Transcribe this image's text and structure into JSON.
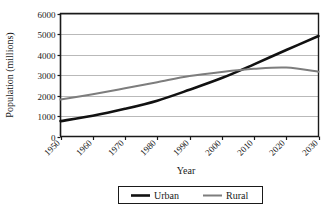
{
  "chart_data": {
    "type": "line",
    "title": "",
    "xlabel": "Year",
    "ylabel": "Population (millions)",
    "x": [
      1950,
      1960,
      1970,
      1980,
      1990,
      2000,
      2010,
      2020,
      2030
    ],
    "categories": [
      "1950",
      "1960",
      "1970",
      "1980",
      "1990",
      "2000",
      "2010",
      "2020",
      "2030"
    ],
    "series": [
      {
        "name": "Urban",
        "color": "#111111",
        "values": [
          750,
          1010,
          1350,
          1750,
          2280,
          2850,
          3520,
          4220,
          4900
        ]
      },
      {
        "name": "Rural",
        "color": "#7d7d7d",
        "values": [
          1800,
          2060,
          2350,
          2650,
          2950,
          3150,
          3300,
          3360,
          3160
        ]
      }
    ],
    "xlim": [
      1950,
      2030
    ],
    "ylim": [
      0,
      6000
    ],
    "ytick_values": [
      0,
      1000,
      2000,
      3000,
      4000,
      5000,
      6000
    ],
    "ytick_labels": [
      "0",
      "1000",
      "2000",
      "3000",
      "4000",
      "5000",
      "6000"
    ],
    "grid": true,
    "grid_axis": "y",
    "legend_position": "bottom"
  },
  "axes": {
    "x_title": "Year",
    "y_title": "Population (millions)"
  },
  "legend": {
    "items": [
      {
        "label": "Urban",
        "color": "#111111",
        "width": 2.6
      },
      {
        "label": "Rural",
        "color": "#7d7d7d",
        "width": 2.0
      }
    ]
  },
  "ticks": {
    "y": [
      "0",
      "1000",
      "2000",
      "3000",
      "4000",
      "5000",
      "6000"
    ],
    "x": [
      "1950",
      "1960",
      "1970",
      "1980",
      "1990",
      "2000",
      "2010",
      "2020",
      "2030"
    ]
  }
}
